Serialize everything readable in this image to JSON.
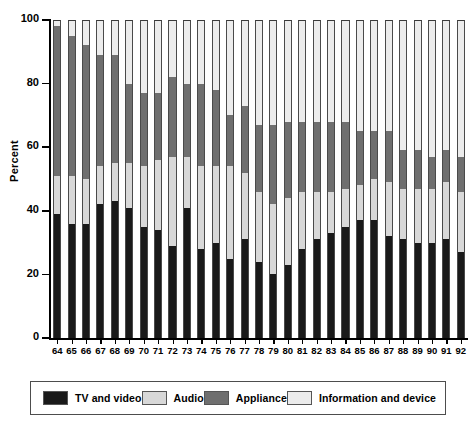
{
  "chart_data": {
    "type": "bar",
    "subtype": "stacked-bar-100",
    "title": "",
    "xlabel": "",
    "ylabel": "Percent",
    "ylim": [
      0,
      100
    ],
    "yticks": [
      0,
      20,
      40,
      60,
      80,
      100
    ],
    "grid": false,
    "legend_position": "bottom",
    "categories": [
      "64",
      "65",
      "66",
      "67",
      "68",
      "69",
      "70",
      "71",
      "72",
      "73",
      "74",
      "75",
      "76",
      "77",
      "78",
      "79",
      "80",
      "81",
      "82",
      "83",
      "84",
      "85",
      "86",
      "87",
      "88",
      "89",
      "90",
      "91",
      "92"
    ],
    "series": [
      {
        "name": "TV and video",
        "color": "#1a1a1a",
        "values": [
          39,
          36,
          36,
          42,
          43,
          41,
          35,
          34,
          29,
          41,
          28,
          30,
          25,
          31,
          24,
          20,
          23,
          28,
          31,
          33,
          35,
          37,
          37,
          32,
          31,
          30,
          30,
          31,
          27
        ]
      },
      {
        "name": "Audio",
        "color": "#d8d8d8",
        "values": [
          12,
          15,
          14,
          12,
          12,
          14,
          19,
          22,
          28,
          16,
          26,
          24,
          29,
          21,
          22,
          22,
          21,
          18,
          15,
          13,
          12,
          11,
          13,
          17,
          16,
          17,
          17,
          18,
          19
        ]
      },
      {
        "name": "Appliance",
        "color": "#6f6f6f",
        "values": [
          47,
          44,
          42,
          35,
          34,
          25,
          23,
          21,
          25,
          23,
          26,
          24,
          16,
          21,
          21,
          25,
          24,
          22,
          22,
          22,
          21,
          17,
          15,
          16,
          12,
          12,
          10,
          10,
          11
        ]
      },
      {
        "name": "Information and device",
        "color": "#ececec",
        "values": [
          2,
          5,
          8,
          11,
          11,
          20,
          23,
          23,
          18,
          20,
          20,
          22,
          30,
          27,
          33,
          33,
          32,
          32,
          32,
          32,
          32,
          35,
          35,
          35,
          41,
          41,
          43,
          41,
          43
        ]
      }
    ]
  },
  "axis": {
    "ylabel": "Percent"
  },
  "legend": {
    "items": [
      {
        "label": "TV and video",
        "color": "#1a1a1a"
      },
      {
        "label": "Audio",
        "color": "#d8d8d8"
      },
      {
        "label": "Appliance",
        "color": "#6f6f6f"
      },
      {
        "label": "Information and device",
        "color": "#ececec"
      }
    ]
  }
}
